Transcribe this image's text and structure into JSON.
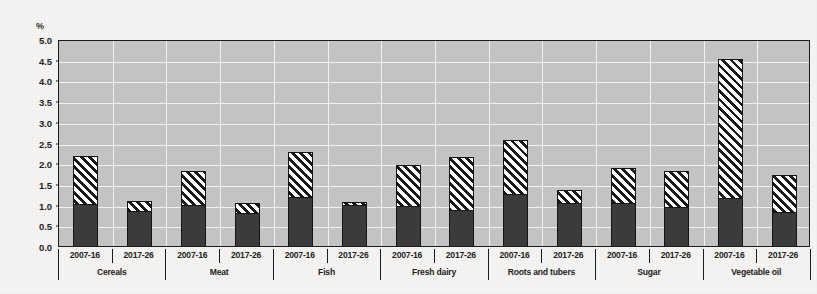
{
  "chart_data": {
    "type": "bar",
    "subtype": "stacked-grouped",
    "title": "",
    "xlabel": "",
    "ylabel": "%",
    "ylim": [
      0.0,
      5.0
    ],
    "ytick_step": 0.5,
    "ytick_labels": [
      "5.0",
      "4.5",
      "4.0",
      "3.5",
      "3.0",
      "2.5",
      "2.0",
      "1.5",
      "1.0",
      "0.5",
      "0.0"
    ],
    "ytick_values": [
      5.0,
      4.5,
      4.0,
      3.5,
      3.0,
      2.5,
      2.0,
      1.5,
      1.0,
      0.5,
      0.0
    ],
    "grid": "horizontal-and-vertical",
    "legend_position": "none",
    "categories": [
      "Cereals",
      "Meat",
      "Fish",
      "Fresh dairy",
      "Roots and tubers",
      "Sugar",
      "Vegetable oil"
    ],
    "periods": [
      "2007-16",
      "2017-26"
    ],
    "segments": [
      {
        "name": "lower-segment",
        "style": "solid-dark",
        "color": "#3b3b3b"
      },
      {
        "name": "upper-segment",
        "style": "diagonal-hatch",
        "color": "#ffffff"
      }
    ],
    "bars": [
      {
        "category": "Cereals",
        "period": "2007-16",
        "lower": 1.02,
        "total": 2.17
      },
      {
        "category": "Cereals",
        "period": "2017-26",
        "lower": 0.85,
        "total": 1.08
      },
      {
        "category": "Meat",
        "period": "2007-16",
        "lower": 1.0,
        "total": 1.82
      },
      {
        "category": "Meat",
        "period": "2017-26",
        "lower": 0.8,
        "total": 1.05
      },
      {
        "category": "Fish",
        "period": "2007-16",
        "lower": 1.18,
        "total": 2.28
      },
      {
        "category": "Fish",
        "period": "2017-26",
        "lower": 1.0,
        "total": 1.07
      },
      {
        "category": "Fresh dairy",
        "period": "2007-16",
        "lower": 0.97,
        "total": 1.95
      },
      {
        "category": "Fresh dairy",
        "period": "2017-26",
        "lower": 0.87,
        "total": 2.15
      },
      {
        "category": "Roots and tubers",
        "period": "2007-16",
        "lower": 1.25,
        "total": 2.55
      },
      {
        "category": "Roots and tubers",
        "period": "2017-26",
        "lower": 1.05,
        "total": 1.35
      },
      {
        "category": "Sugar",
        "period": "2007-16",
        "lower": 1.05,
        "total": 1.88
      },
      {
        "category": "Sugar",
        "period": "2017-26",
        "lower": 0.95,
        "total": 1.8
      },
      {
        "category": "Vegetable oil",
        "period": "2007-16",
        "lower": 1.15,
        "total": 4.52
      },
      {
        "category": "Vegetable oil",
        "period": "2017-26",
        "lower": 0.82,
        "total": 1.72
      }
    ],
    "colors": {
      "plot_background": "#c3c3c3",
      "gridline": "#f2f2f2",
      "axis": "#1a1a1a",
      "bar_solid": "#3b3b3b",
      "bar_hatch_line": "#191919",
      "bar_hatch_background": "#ffffff",
      "page_background": "#f5f4f2"
    }
  }
}
